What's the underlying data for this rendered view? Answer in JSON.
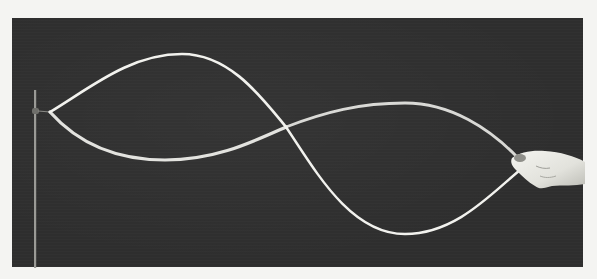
{
  "image": {
    "subject": "standing wave on a string",
    "description": "Long-exposure photograph of a rope vibrating in a standing wave with two loops, one end fixed to a vertical post on the left, the other held by a hand on the right",
    "background_color": "#2e2e2e",
    "string_color": "#f2f2ee",
    "page_color": "#f4f4f2"
  },
  "wave": {
    "loops": 2,
    "nodes": [
      {
        "name": "fixed-end",
        "x": 50,
        "y": 112
      },
      {
        "name": "middle-node",
        "x": 286,
        "y": 127
      },
      {
        "name": "hand-end",
        "x": 520,
        "y": 160
      }
    ],
    "antinodes": [
      {
        "loop": 1,
        "upper": {
          "x": 182,
          "y": 54
        },
        "lower": {
          "x": 165,
          "y": 160
        }
      },
      {
        "loop": 2,
        "upper": {
          "x": 405,
          "y": 103
        },
        "lower": {
          "x": 405,
          "y": 234
        }
      }
    ]
  }
}
